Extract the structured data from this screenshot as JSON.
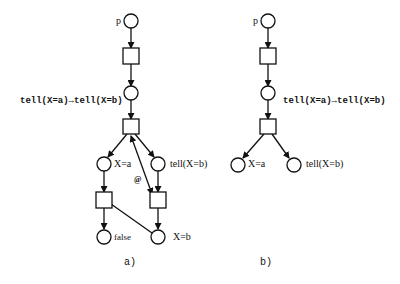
{
  "diagram_a": {
    "caption": "a)",
    "place_p_label": "p",
    "condition_label": "tell(X=a)→tell(X=b)",
    "place_xa_label": "X=a",
    "place_tell_label": "tell(X=b)",
    "arc_label": "@",
    "place_false_label": "false",
    "place_xb_label": "X=b"
  },
  "diagram_b": {
    "caption": "b)",
    "place_p_label": "p",
    "condition_label": "tell(X=a)→tell(X=b)",
    "place_xa_label": "X=a",
    "place_tell_label": "tell(X=b)"
  }
}
